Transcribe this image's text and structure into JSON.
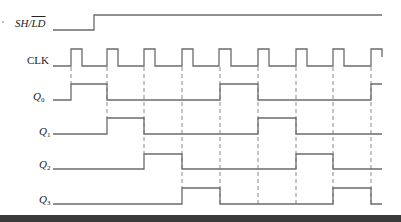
{
  "diagram": {
    "colors": {
      "trace": "#6b6b6b",
      "dash": "#8a8a8a",
      "bottom_bar": "#3a3a3a",
      "background": "#ffffff"
    },
    "signals": [
      {
        "id": "shld",
        "label_main": "SH/",
        "label_over": "LD",
        "y_low": 30,
        "y_high": 15,
        "transitions": [
          [
            53,
            0
          ],
          [
            94,
            1
          ],
          [
            382,
            1
          ]
        ]
      },
      {
        "id": "clk",
        "label": "CLK",
        "y_low": 66,
        "y_high": 49,
        "pulses": [
          [
            71,
            82
          ],
          [
            107,
            118
          ],
          [
            144,
            155
          ],
          [
            182,
            193
          ],
          [
            219,
            231
          ],
          [
            258,
            269
          ],
          [
            296,
            307
          ],
          [
            333,
            344
          ],
          [
            371,
            382
          ]
        ],
        "x_start": 53,
        "x_end": 382
      },
      {
        "id": "q0",
        "label": "Q",
        "sub": "0",
        "y_low": 100,
        "y_high": 84,
        "high_intervals": [
          [
            71,
            107
          ],
          [
            220,
            258
          ],
          [
            371,
            382
          ]
        ]
      },
      {
        "id": "q1",
        "label": "Q",
        "sub": "1",
        "y_low": 134,
        "y_high": 118,
        "high_intervals": [
          [
            107,
            144
          ],
          [
            258,
            296
          ]
        ]
      },
      {
        "id": "q2",
        "label": "Q",
        "sub": "2",
        "y_low": 169,
        "y_high": 154,
        "high_intervals": [
          [
            144,
            182
          ],
          [
            296,
            333
          ]
        ]
      },
      {
        "id": "q3",
        "label": "Q",
        "sub": "3",
        "y_low": 204,
        "y_high": 188,
        "high_intervals": [
          [
            182,
            220
          ],
          [
            333,
            371
          ]
        ]
      }
    ],
    "x_start": 53,
    "x_end": 382,
    "clock_edge_markers": [
      {
        "x": 71,
        "y_end": 84
      },
      {
        "x": 107,
        "y_end": 118
      },
      {
        "x": 144,
        "y_end": 154
      },
      {
        "x": 182,
        "y_end": 188
      },
      {
        "x": 220,
        "y_end": 204
      },
      {
        "x": 258,
        "y_end": 204
      },
      {
        "x": 296,
        "y_end": 204
      },
      {
        "x": 333,
        "y_end": 204
      },
      {
        "x": 371,
        "y_end": 204
      }
    ],
    "labels": {
      "shld_main": "SH/",
      "shld_over": "LD",
      "clk": "CLK",
      "q": "Q",
      "q0_sub": "0",
      "q1_sub": "1",
      "q2_sub": "2",
      "q3_sub": "3"
    }
  }
}
